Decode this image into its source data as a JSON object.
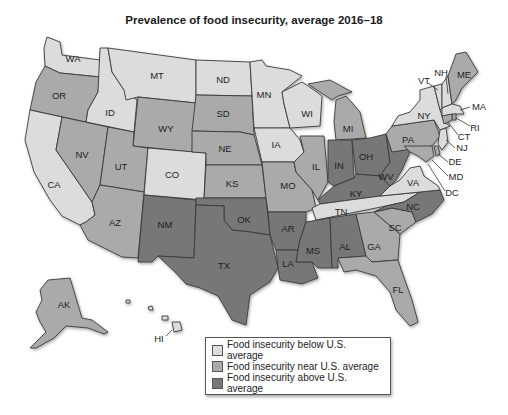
{
  "title": "Prevalence of food insecurity, average 2016–18",
  "colors": {
    "below": "#dcdcdc",
    "near": "#aaaaaa",
    "above": "#777777",
    "border": "#3a3a3a"
  },
  "legend": {
    "items": [
      {
        "key": "below",
        "label": "Food insecurity below U.S. average",
        "color": "#dcdcdc"
      },
      {
        "key": "near",
        "label": "Food insecurity near U.S. average",
        "color": "#aaaaaa"
      },
      {
        "key": "above",
        "label": "Food insecurity above U.S. average",
        "color": "#777777"
      }
    ]
  },
  "states": {
    "WA": {
      "label": "WA",
      "category": "below"
    },
    "OR": {
      "label": "OR",
      "category": "near"
    },
    "CA": {
      "label": "CA",
      "category": "below"
    },
    "ID": {
      "label": "ID",
      "category": "below"
    },
    "NV": {
      "label": "NV",
      "category": "near"
    },
    "MT": {
      "label": "MT",
      "category": "below"
    },
    "WY": {
      "label": "WY",
      "category": "near"
    },
    "UT": {
      "label": "UT",
      "category": "near"
    },
    "AZ": {
      "label": "AZ",
      "category": "near"
    },
    "CO": {
      "label": "CO",
      "category": "below"
    },
    "NM": {
      "label": "NM",
      "category": "above"
    },
    "ND": {
      "label": "ND",
      "category": "below"
    },
    "SD": {
      "label": "SD",
      "category": "near"
    },
    "NE": {
      "label": "NE",
      "category": "near"
    },
    "KS": {
      "label": "KS",
      "category": "near"
    },
    "OK": {
      "label": "OK",
      "category": "above"
    },
    "TX": {
      "label": "TX",
      "category": "above"
    },
    "MN": {
      "label": "MN",
      "category": "below"
    },
    "IA": {
      "label": "IA",
      "category": "below"
    },
    "MO": {
      "label": "MO",
      "category": "near"
    },
    "AR": {
      "label": "AR",
      "category": "above"
    },
    "LA": {
      "label": "LA",
      "category": "above"
    },
    "WI": {
      "label": "WI",
      "category": "below"
    },
    "IL": {
      "label": "IL",
      "category": "near"
    },
    "MI": {
      "label": "MI",
      "category": "near"
    },
    "IN": {
      "label": "IN",
      "category": "above"
    },
    "OH": {
      "label": "OH",
      "category": "above"
    },
    "KY": {
      "label": "KY",
      "category": "above"
    },
    "TN": {
      "label": "TN",
      "category": "below"
    },
    "MS": {
      "label": "MS",
      "category": "above"
    },
    "AL": {
      "label": "AL",
      "category": "above"
    },
    "GA": {
      "label": "GA",
      "category": "near"
    },
    "FL": {
      "label": "FL",
      "category": "near"
    },
    "SC": {
      "label": "SC",
      "category": "near"
    },
    "NC": {
      "label": "NC",
      "category": "above"
    },
    "VA": {
      "label": "VA",
      "category": "below"
    },
    "WV": {
      "label": "WV",
      "category": "above"
    },
    "PA": {
      "label": "PA",
      "category": "near"
    },
    "NY": {
      "label": "NY",
      "category": "below"
    },
    "VT": {
      "label": "VT",
      "category": "below"
    },
    "NH": {
      "label": "NH",
      "category": "below"
    },
    "ME": {
      "label": "ME",
      "category": "near"
    },
    "MA": {
      "label": "MA",
      "category": "below"
    },
    "RI": {
      "label": "RI",
      "category": "near"
    },
    "CT": {
      "label": "CT",
      "category": "near"
    },
    "NJ": {
      "label": "NJ",
      "category": "below"
    },
    "DE": {
      "label": "DE",
      "category": "near"
    },
    "MD": {
      "label": "MD",
      "category": "near"
    },
    "DC": {
      "label": "DC",
      "category": "near"
    },
    "AK": {
      "label": "AK",
      "category": "near"
    },
    "HI": {
      "label": "HI",
      "category": "below"
    }
  }
}
